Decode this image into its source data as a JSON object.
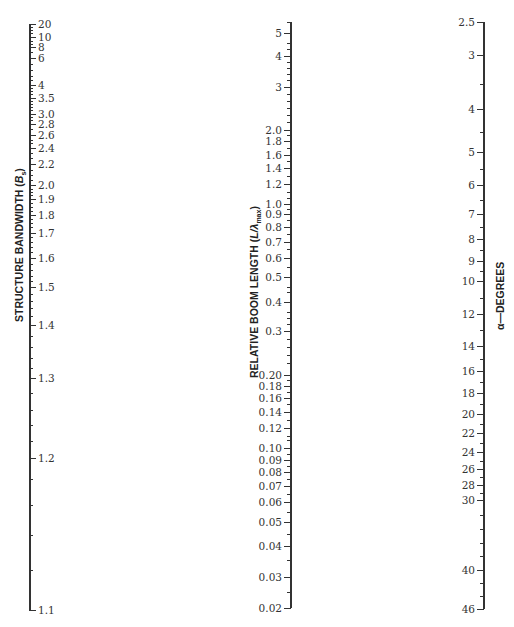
{
  "chart_data": {
    "type": "nomograph",
    "title": "",
    "scales": [
      {
        "name": "structure-bandwidth",
        "title": "STRUCTURE BANDWIDTH (B_s)",
        "title_main": "STRUCTURE BANDWIDTH (",
        "title_var": "B",
        "title_sub": "s",
        "title_end": ")",
        "axis_x": 29,
        "y_top": 24,
        "y_bottom": 610,
        "label_side": "right",
        "range": [
          1.1,
          20
        ],
        "ticks": [
          {
            "label": "20",
            "value": 20,
            "y": 24
          },
          {
            "label": "10",
            "value": 10,
            "y": 37
          },
          {
            "label": "8",
            "value": 8,
            "y": 47
          },
          {
            "label": "6",
            "value": 6,
            "y": 58
          },
          {
            "label": "4",
            "value": 4,
            "y": 85
          },
          {
            "label": "3.5",
            "value": 3.5,
            "y": 98
          },
          {
            "label": "3.0",
            "value": 3.0,
            "y": 114
          },
          {
            "label": "2.8",
            "value": 2.8,
            "y": 124
          },
          {
            "label": "2.6",
            "value": 2.6,
            "y": 135
          },
          {
            "label": "2.4",
            "value": 2.4,
            "y": 148
          },
          {
            "label": "2.2",
            "value": 2.2,
            "y": 164
          },
          {
            "label": "2.0",
            "value": 2.0,
            "y": 185
          },
          {
            "label": "1.9",
            "value": 1.9,
            "y": 199
          },
          {
            "label": "1.8",
            "value": 1.8,
            "y": 215
          },
          {
            "label": "1.7",
            "value": 1.7,
            "y": 233
          },
          {
            "label": "1.6",
            "value": 1.6,
            "y": 258
          },
          {
            "label": "1.5",
            "value": 1.5,
            "y": 287
          },
          {
            "label": "1.4",
            "value": 1.4,
            "y": 325
          },
          {
            "label": "1.3",
            "value": 1.3,
            "y": 378
          },
          {
            "label": "1.2",
            "value": 1.2,
            "y": 458
          },
          {
            "label": "1.1",
            "value": 1.1,
            "y": 610
          }
        ],
        "minor_ticks_y": [
          27,
          30,
          33,
          41,
          44,
          52,
          64,
          70,
          76,
          80,
          88,
          91,
          94,
          101,
          104,
          107,
          110,
          117,
          120,
          129,
          140,
          143,
          153,
          158,
          170,
          175,
          180,
          189,
          192,
          195,
          203,
          207,
          211,
          219,
          223,
          227,
          237,
          242,
          247,
          252,
          264,
          270,
          276,
          281,
          294,
          301,
          308,
          316,
          336,
          347,
          358,
          368,
          393,
          410,
          425,
          441,
          479,
          505,
          535,
          570
        ]
      },
      {
        "name": "relative-boom-length",
        "title": "RELATIVE BOOM LENGTH (L/λmax)",
        "title_main": "RELATIVE BOOM LENGTH (",
        "title_var": "L/λ",
        "title_sub": "max",
        "title_end": ")",
        "axis_x": 290,
        "y_top": 22,
        "y_bottom": 608,
        "label_side": "left",
        "range": [
          0.02,
          5
        ],
        "ticks": [
          {
            "label": "5",
            "value": 5,
            "y": 33
          },
          {
            "label": "4",
            "value": 4,
            "y": 56
          },
          {
            "label": "3",
            "value": 3,
            "y": 87
          },
          {
            "label": "2.0",
            "value": 2.0,
            "y": 130
          },
          {
            "label": "1.8",
            "value": 1.8,
            "y": 141
          },
          {
            "label": "1.6",
            "value": 1.6,
            "y": 155
          },
          {
            "label": "1.4",
            "value": 1.4,
            "y": 168
          },
          {
            "label": "1.2",
            "value": 1.2,
            "y": 184
          },
          {
            "label": "1.0",
            "value": 1.0,
            "y": 204
          },
          {
            "label": "0.9",
            "value": 0.9,
            "y": 214
          },
          {
            "label": "0.8",
            "value": 0.8,
            "y": 227
          },
          {
            "label": "0.7",
            "value": 0.7,
            "y": 242
          },
          {
            "label": "0.6",
            "value": 0.6,
            "y": 258
          },
          {
            "label": "0.5",
            "value": 0.5,
            "y": 277
          },
          {
            "label": "0.4",
            "value": 0.4,
            "y": 302
          },
          {
            "label": "0.3",
            "value": 0.3,
            "y": 331
          },
          {
            "label": "0.20",
            "value": 0.2,
            "y": 375
          },
          {
            "label": "0.18",
            "value": 0.18,
            "y": 386
          },
          {
            "label": "0.16",
            "value": 0.16,
            "y": 398
          },
          {
            "label": "0.14",
            "value": 0.14,
            "y": 412
          },
          {
            "label": "0.12",
            "value": 0.12,
            "y": 428
          },
          {
            "label": "0.10",
            "value": 0.1,
            "y": 448
          },
          {
            "label": "0.09",
            "value": 0.09,
            "y": 460
          },
          {
            "label": "0.08",
            "value": 0.08,
            "y": 472
          },
          {
            "label": "0.07",
            "value": 0.07,
            "y": 486
          },
          {
            "label": "0.06",
            "value": 0.06,
            "y": 502
          },
          {
            "label": "0.05",
            "value": 0.05,
            "y": 522
          },
          {
            "label": "0.04",
            "value": 0.04,
            "y": 546
          },
          {
            "label": "0.03",
            "value": 0.03,
            "y": 577
          },
          {
            "label": "0.02",
            "value": 0.02,
            "y": 608
          }
        ],
        "minor_ticks_y": [
          22,
          43,
          49,
          62,
          68,
          74,
          80,
          94,
          101,
          108,
          115,
          122,
          135,
          148,
          161,
          176,
          192,
          198,
          209,
          220,
          234,
          249,
          267,
          287,
          292,
          312,
          318,
          324,
          339,
          347,
          355,
          363,
          380,
          392,
          404,
          420,
          436,
          440,
          454,
          466,
          479,
          494,
          512,
          534,
          560,
          592
        ]
      },
      {
        "name": "alpha-degrees",
        "title": "α—DEGREES",
        "title_main": "α—DEGREES",
        "title_var": "",
        "title_sub": "",
        "title_end": "",
        "axis_x": 483,
        "y_top": 22,
        "y_bottom": 609,
        "label_side": "left",
        "range": [
          2.5,
          46
        ],
        "ticks": [
          {
            "label": "2.5",
            "value": 2.5,
            "y": 22
          },
          {
            "label": "3",
            "value": 3,
            "y": 55
          },
          {
            "label": "4",
            "value": 4,
            "y": 109
          },
          {
            "label": "5",
            "value": 5,
            "y": 152
          },
          {
            "label": "6",
            "value": 6,
            "y": 185
          },
          {
            "label": "7",
            "value": 7,
            "y": 214
          },
          {
            "label": "8",
            "value": 8,
            "y": 239
          },
          {
            "label": "9",
            "value": 9,
            "y": 261
          },
          {
            "label": "10",
            "value": 10,
            "y": 281
          },
          {
            "label": "12",
            "value": 12,
            "y": 314
          },
          {
            "label": "14",
            "value": 14,
            "y": 346
          },
          {
            "label": "16",
            "value": 16,
            "y": 371
          },
          {
            "label": "18",
            "value": 18,
            "y": 393
          },
          {
            "label": "20",
            "value": 20,
            "y": 414
          },
          {
            "label": "22",
            "value": 22,
            "y": 433
          },
          {
            "label": "24",
            "value": 24,
            "y": 452
          },
          {
            "label": "26",
            "value": 26,
            "y": 469
          },
          {
            "label": "28",
            "value": 28,
            "y": 485
          },
          {
            "label": "30",
            "value": 30,
            "y": 500
          },
          {
            "label": "40",
            "value": 40,
            "y": 570
          },
          {
            "label": "46",
            "value": 46,
            "y": 609
          }
        ],
        "minor_ticks_y": [
          84,
          132,
          169,
          200,
          227,
          250,
          271,
          298,
          330,
          359,
          382,
          404,
          424,
          443,
          461,
          477,
          493,
          515,
          529,
          543,
          556,
          583,
          596
        ]
      }
    ],
    "xlabel": "",
    "ylabel": "",
    "grid": false,
    "legend": null
  }
}
